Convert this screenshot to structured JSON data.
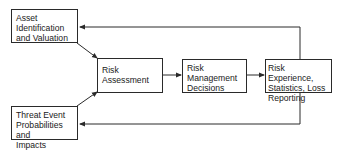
{
  "diagram": {
    "nodes": [
      {
        "id": "asset",
        "label": "Asset Identification and Valuation",
        "lines": [
          "Asset",
          "Identification",
          "and Valuation"
        ]
      },
      {
        "id": "threat",
        "label": "Threat Event Probabilities and Impacts",
        "lines": [
          "Threat Event",
          "Probabilities and",
          "Impacts"
        ]
      },
      {
        "id": "assessment",
        "label": "Risk Assessment",
        "lines": [
          "Risk",
          "Assessment"
        ]
      },
      {
        "id": "decisions",
        "label": "Risk Management Decisions",
        "lines": [
          "Risk",
          "Management",
          "Decisions"
        ]
      },
      {
        "id": "experience",
        "label": "Risk Experience, Statistics, Loss Reporting",
        "lines": [
          "Risk Experience,",
          "Statistics, Loss",
          "Reporting"
        ]
      }
    ],
    "edges": [
      {
        "from": "asset",
        "to": "assessment"
      },
      {
        "from": "threat",
        "to": "assessment"
      },
      {
        "from": "assessment",
        "to": "decisions"
      },
      {
        "from": "decisions",
        "to": "experience"
      },
      {
        "from": "experience",
        "to": "asset"
      },
      {
        "from": "experience",
        "to": "threat"
      }
    ]
  }
}
